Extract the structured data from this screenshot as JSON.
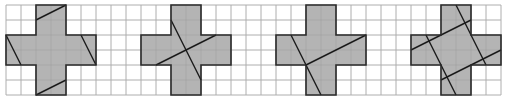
{
  "colors": {
    "background": "#ffffff",
    "grid": "#c8c8c8",
    "fill": "#b4b4b4",
    "outline": "#2a2a2a",
    "cut_line": "#1a1a1a"
  },
  "grid": {
    "origin_x": 6,
    "origin_y": 5,
    "cell": 15,
    "cols": 33,
    "rows": 6
  },
  "figures": [
    {
      "name": "cross-1",
      "offset_col": 0,
      "cuts": [
        [
          2,
          1,
          4,
          0
        ],
        [
          2,
          6,
          4,
          5
        ],
        [
          0,
          2,
          1,
          4
        ],
        [
          5,
          2,
          6,
          4
        ]
      ]
    },
    {
      "name": "cross-2",
      "offset_col": 9,
      "cuts": [
        [
          2,
          1,
          4,
          5
        ],
        [
          1,
          4,
          5,
          2
        ]
      ]
    },
    {
      "name": "cross-3",
      "offset_col": 18,
      "cuts": [
        [
          1,
          2,
          3,
          6
        ],
        [
          2,
          4,
          6,
          2
        ]
      ]
    },
    {
      "name": "cross-4",
      "offset_col": 27,
      "cuts": [
        [
          3,
          0,
          5,
          4
        ],
        [
          0,
          3,
          4,
          1
        ],
        [
          1,
          2,
          3,
          6
        ],
        [
          2,
          5,
          6,
          3
        ]
      ]
    }
  ]
}
